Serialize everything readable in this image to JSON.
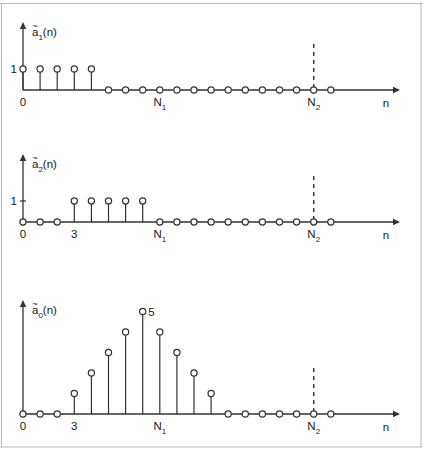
{
  "figure": {
    "title": "",
    "background": "#ffffff",
    "ink_color": "#33332e"
  },
  "axis_labels": {
    "x_axis": "n",
    "origin": "0",
    "tick_three": "3",
    "tick_N1": "N",
    "tick_N1_sub": "1",
    "tick_N2": "N",
    "tick_N2_sub": "2",
    "unit_one": "1",
    "peak_five": "5"
  },
  "chart_data": [
    {
      "type": "stem",
      "id": "plot-a1",
      "title": "ã₁(n)",
      "title_base": "a",
      "title_sub": "1",
      "title_arg": "(n)",
      "xlabel": "n",
      "ylabel": "",
      "x": [
        0,
        1,
        2,
        3,
        4,
        5,
        6,
        7,
        8,
        9,
        10,
        11,
        12,
        13,
        14,
        15,
        16,
        17,
        18
      ],
      "values": [
        1,
        1,
        1,
        1,
        1,
        0,
        0,
        0,
        0,
        0,
        0,
        0,
        0,
        0,
        0,
        0,
        0,
        0,
        0
      ],
      "ylim": [
        0,
        2.6
      ],
      "ytick_values": [
        1
      ],
      "ytick_labels": [
        "1"
      ],
      "xtick_positions": [
        0,
        8,
        17
      ],
      "xtick_labels": [
        "0",
        "N1",
        "N2"
      ],
      "markers": "open-circle",
      "annotations": [],
      "vertical_dashed_at": 17,
      "grid": false,
      "legend": false
    },
    {
      "type": "stem",
      "id": "plot-a2",
      "title": "ã₂(n)",
      "title_base": "a",
      "title_sub": "2",
      "title_arg": "(n)",
      "xlabel": "n",
      "ylabel": "",
      "x": [
        0,
        1,
        2,
        3,
        4,
        5,
        6,
        7,
        8,
        9,
        10,
        11,
        12,
        13,
        14,
        15,
        16,
        17,
        18
      ],
      "values": [
        0,
        0,
        0,
        1,
        1,
        1,
        1,
        1,
        0,
        0,
        0,
        0,
        0,
        0,
        0,
        0,
        0,
        0,
        0
      ],
      "ylim": [
        0,
        2.6
      ],
      "ytick_values": [
        1
      ],
      "ytick_labels": [
        "1"
      ],
      "xtick_positions": [
        0,
        3,
        8,
        17
      ],
      "xtick_labels": [
        "0",
        "3",
        "N1",
        "N2"
      ],
      "markers": "open-circle",
      "annotations": [],
      "vertical_dashed_at": 17,
      "grid": false,
      "legend": false
    },
    {
      "type": "stem",
      "id": "plot-a0",
      "title": "ã₀(n)",
      "title_base": "a",
      "title_sub": "0",
      "title_arg": "(n)",
      "xlabel": "n",
      "ylabel": "",
      "x": [
        0,
        1,
        2,
        3,
        4,
        5,
        6,
        7,
        8,
        9,
        10,
        11,
        12,
        13,
        14,
        15,
        16,
        17,
        18
      ],
      "values": [
        0,
        0,
        0,
        1,
        2,
        3,
        4,
        5,
        4,
        3,
        2,
        1,
        0,
        0,
        0,
        0,
        0,
        0,
        0
      ],
      "ylim": [
        0,
        6.0
      ],
      "ytick_values": [],
      "ytick_labels": [],
      "xtick_positions": [
        0,
        3,
        8,
        17
      ],
      "xtick_labels": [
        "0",
        "3",
        "N1",
        "N2"
      ],
      "markers": "open-circle",
      "annotations": [
        {
          "x": 7,
          "y": 5,
          "text": "5"
        }
      ],
      "vertical_dashed_at": 17,
      "grid": false,
      "legend": false
    }
  ]
}
